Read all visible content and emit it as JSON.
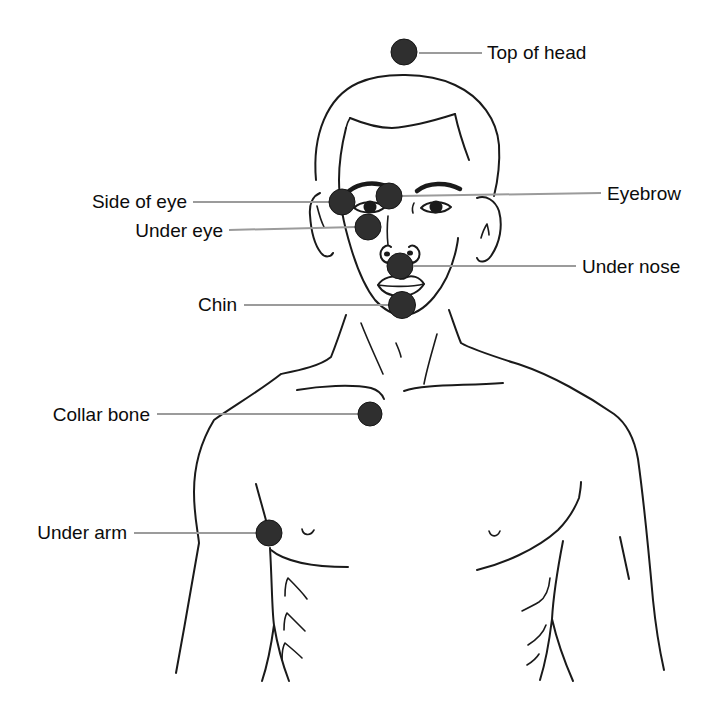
{
  "figure": {
    "points": [
      {
        "id": "top-of-head",
        "label": "Top of head",
        "side": "right"
      },
      {
        "id": "eyebrow",
        "label": "Eyebrow",
        "side": "right"
      },
      {
        "id": "side-of-eye",
        "label": "Side of eye",
        "side": "left"
      },
      {
        "id": "under-eye",
        "label": "Under eye",
        "side": "left"
      },
      {
        "id": "under-nose",
        "label": "Under nose",
        "side": "right"
      },
      {
        "id": "chin",
        "label": "Chin",
        "side": "left"
      },
      {
        "id": "collar-bone",
        "label": "Collar bone",
        "side": "left"
      },
      {
        "id": "under-arm",
        "label": "Under arm",
        "side": "left"
      }
    ],
    "colors": {
      "marker": "#2f2f2f",
      "outline": "#1a1a1a",
      "leader": "#9b9b9b",
      "text": "#0c0c0c",
      "background": "#ffffff"
    }
  }
}
